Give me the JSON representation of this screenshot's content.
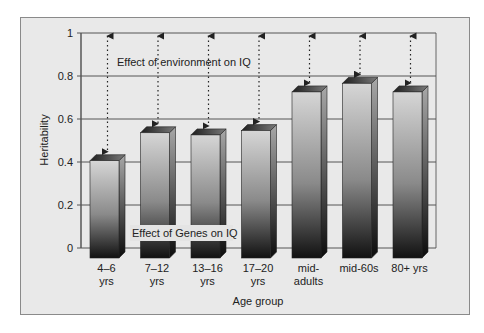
{
  "chart_data": {
    "type": "bar",
    "title": "",
    "xlabel": "Age group",
    "ylabel": "Heritability",
    "ylim": [
      0,
      1
    ],
    "yticks": [
      0,
      0.2,
      0.4,
      0.6,
      0.8,
      1
    ],
    "ytick_labels": [
      "0",
      "0.2",
      "0.4",
      "0.6",
      "0.8",
      "1"
    ],
    "grid": true,
    "legend": null,
    "categories": [
      "4–6 yrs",
      "7–12 yrs",
      "13–16 yrs",
      "17–20 yrs",
      "mid-adults",
      "mid-60s",
      "80+ yrs"
    ],
    "category_lines": [
      [
        "4–6",
        "yrs"
      ],
      [
        "7–12",
        "yrs"
      ],
      [
        "13–16",
        "yrs"
      ],
      [
        "17–20",
        "yrs"
      ],
      [
        "mid-",
        "adults"
      ],
      [
        "mid-60s"
      ],
      [
        "80+ yrs"
      ]
    ],
    "values": [
      0.42,
      0.55,
      0.54,
      0.56,
      0.74,
      0.78,
      0.74
    ],
    "annotations": [
      {
        "text": "Effect of environment on IQ",
        "region": "above bars (dotted double-headed arrows from bar top to 1.0)"
      },
      {
        "text": "Effect of Genes on IQ",
        "region": "within bars near baseline"
      }
    ],
    "style": "3D gradient bars (light top to dark bottom)"
  },
  "colors": {
    "panel_bg": "#e9e9e9",
    "panel_border": "#8a8a8a",
    "gridline": "#555555",
    "bar_light": "#d6d6d6",
    "bar_dark": "#111111",
    "bar_top": "#4a4a4a"
  }
}
